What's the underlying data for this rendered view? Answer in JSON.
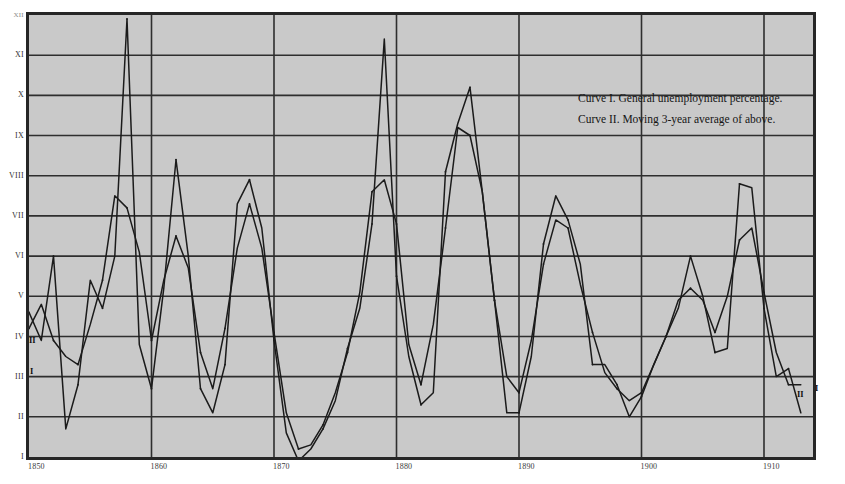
{
  "figure": {
    "background_color": "#ffffff",
    "plot_background_color": "#c9c9c9",
    "frame_color": "#262626",
    "curve_color": "#1b1b1b",
    "grid_color": "#2e2e2e"
  },
  "legend": {
    "entries": [
      "Curve I. General unemployment percentage.",
      "Curve II. Moving 3-year average of above."
    ]
  },
  "annotations": {
    "left_curve_ii": "II",
    "left_curve_i": "I",
    "right_curve_ii": "II",
    "right_curve_i": "I"
  },
  "caption": {
    "text": ""
  },
  "chart_data": {
    "type": "line",
    "title": "",
    "subtitle": "",
    "xlabel": "",
    "ylabel": "",
    "xlim": [
      1850,
      1914
    ],
    "ylim": [
      1,
      12
    ],
    "grid": true,
    "legend_position": "top-right",
    "xticks": [
      1850,
      1860,
      1870,
      1880,
      1890,
      1900,
      1910
    ],
    "xtick_labels": [
      "1850",
      "1860",
      "1870",
      "1880",
      "1890",
      "1900",
      "1910"
    ],
    "yticks": [
      1,
      2,
      3,
      4,
      5,
      6,
      7,
      8,
      9,
      10,
      11,
      12
    ],
    "ytick_labels": [
      "I",
      "II",
      "III",
      "IV",
      "V",
      "VI",
      "VII",
      "VIII",
      "IX",
      "X",
      "XI",
      "XII"
    ],
    "x": [
      1850,
      1851,
      1852,
      1853,
      1854,
      1855,
      1856,
      1857,
      1858,
      1859,
      1860,
      1861,
      1862,
      1863,
      1864,
      1865,
      1866,
      1867,
      1868,
      1869,
      1870,
      1871,
      1872,
      1873,
      1874,
      1875,
      1876,
      1877,
      1878,
      1879,
      1880,
      1881,
      1882,
      1883,
      1884,
      1885,
      1886,
      1887,
      1888,
      1889,
      1890,
      1891,
      1892,
      1893,
      1894,
      1895,
      1896,
      1897,
      1898,
      1899,
      1900,
      1901,
      1902,
      1903,
      1904,
      1905,
      1906,
      1907,
      1908,
      1909,
      1910,
      1911,
      1912,
      1913
    ],
    "series": [
      {
        "name": "Curve I. General unemployment percentage.",
        "label": "I",
        "values": [
          4.6,
          3.9,
          6.0,
          1.7,
          2.8,
          5.4,
          4.7,
          6.0,
          11.9,
          3.8,
          2.7,
          5.2,
          8.4,
          6.0,
          2.7,
          2.1,
          3.3,
          7.3,
          7.9,
          6.7,
          3.9,
          1.6,
          0.9,
          1.2,
          1.7,
          2.4,
          3.7,
          4.7,
          6.8,
          11.4,
          5.5,
          3.5,
          2.3,
          2.6,
          8.1,
          9.3,
          10.2,
          7.6,
          4.9,
          2.1,
          2.1,
          3.5,
          6.3,
          7.5,
          6.9,
          5.8,
          3.3,
          3.3,
          2.8,
          2.0,
          2.5,
          3.3,
          4.0,
          4.7,
          6.0,
          5.0,
          3.6,
          3.7,
          7.8,
          7.7,
          4.7,
          3.0,
          3.2,
          2.1
        ]
      },
      {
        "name": "Curve II. Moving 3-year average of above.",
        "label": "II",
        "values": [
          4.2,
          4.8,
          3.9,
          3.5,
          3.3,
          4.3,
          5.4,
          7.5,
          7.2,
          6.1,
          3.9,
          5.4,
          6.5,
          5.7,
          3.6,
          2.7,
          4.2,
          6.2,
          7.3,
          6.2,
          4.1,
          2.1,
          1.2,
          1.3,
          1.8,
          2.6,
          3.6,
          5.1,
          7.6,
          7.9,
          6.8,
          3.8,
          2.8,
          4.3,
          6.7,
          9.2,
          9.0,
          7.6,
          4.9,
          3.0,
          2.6,
          3.9,
          5.8,
          6.9,
          6.7,
          5.3,
          4.1,
          3.1,
          2.7,
          2.4,
          2.6,
          3.3,
          4.0,
          4.9,
          5.2,
          4.9,
          4.1,
          5.0,
          6.4,
          6.7,
          5.1,
          3.6,
          2.8,
          2.8
        ]
      }
    ]
  }
}
